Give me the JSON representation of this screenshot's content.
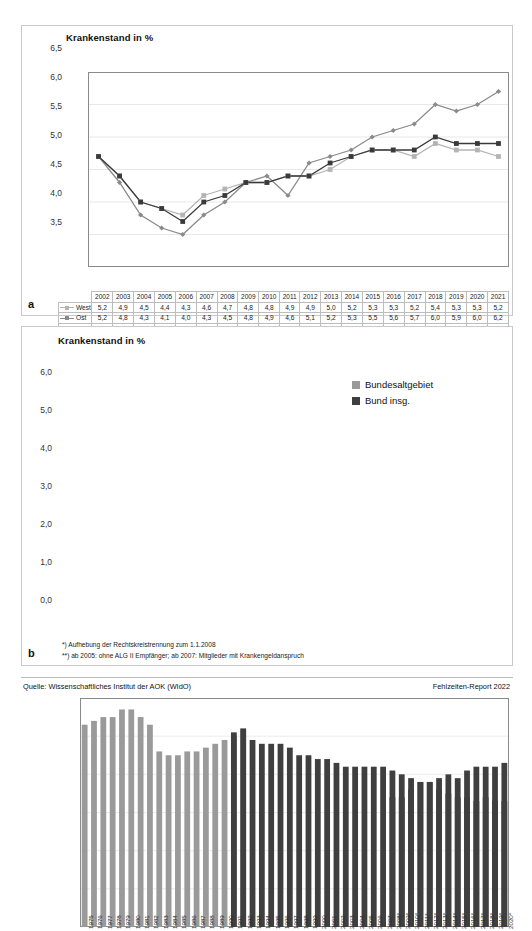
{
  "figure": {
    "source_label": "Quelle: Wissenschaftliches Institut der AOK (WIdO)",
    "report_label": "Fehlzeiten-Report 2022",
    "panel_a_letter": "a",
    "panel_b_letter": "b"
  },
  "panel_a": {
    "title": "Krankenstand in %",
    "yticks": [
      "6,5",
      "6,0",
      "5,5",
      "5,0",
      "4,5",
      "4,0",
      "3,5"
    ],
    "table": {
      "years": [
        "2002",
        "2003",
        "2004",
        "2005",
        "2006",
        "2007",
        "2008",
        "2009",
        "2010",
        "2011",
        "2012",
        "2013",
        "2014",
        "2015",
        "2016",
        "2017",
        "2018",
        "2019",
        "2020",
        "2021"
      ],
      "rows": [
        {
          "label": "West",
          "color": "#b4b4b4",
          "values": [
            "5,2",
            "4,9",
            "4,5",
            "4,4",
            "4,3",
            "4,6",
            "4,7",
            "4,8",
            "4,8",
            "4,9",
            "4,9",
            "5,0",
            "5,2",
            "5,3",
            "5,3",
            "5,2",
            "5,4",
            "5,3",
            "5,3",
            "5,2"
          ]
        },
        {
          "label": "Ost",
          "color": "#8a8a8a",
          "values": [
            "5,2",
            "4,8",
            "4,3",
            "4,1",
            "4,0",
            "4,3",
            "4,5",
            "4,8",
            "4,9",
            "4,6",
            "5,1",
            "5,2",
            "5,3",
            "5,5",
            "5,6",
            "5,7",
            "6,0",
            "5,9",
            "6,0",
            "6,2"
          ]
        },
        {
          "label": "Bund",
          "color": "#3a3a3a",
          "values": [
            "5,2",
            "4,9",
            "4,5",
            "4,4",
            "4,2",
            "4,5",
            "4,6",
            "4,8",
            "4,8",
            "4,9",
            "4,9",
            "5,1",
            "5,2",
            "5,3",
            "5,3",
            "5,3",
            "5,5",
            "5,4",
            "5,4",
            "5,4"
          ]
        }
      ]
    }
  },
  "panel_b": {
    "title": "Krankenstand in %",
    "yticks": [
      "6,0",
      "5,0",
      "4,0",
      "3,0",
      "2,0",
      "1,0",
      "0,0"
    ],
    "legend": [
      {
        "label": "Bundesaltgebiet",
        "color": "#9a9a9a"
      },
      {
        "label": "Bund insg.",
        "color": "#3f3f3f"
      }
    ],
    "footnotes": [
      "*) Aufhebung der Rechtskreistrennung zum 1.1.2008",
      "**) ab 2005: ohne ALG II Empfänger; ab 2007: Mitglieder mit Krankengeldanspruch"
    ]
  },
  "chart_data": [
    {
      "type": "line",
      "title": "Krankenstand in %",
      "xlabel": "",
      "ylabel": "Krankenstand in %",
      "ylim": [
        3.5,
        6.5
      ],
      "ytick_values": [
        3.5,
        4.0,
        4.5,
        5.0,
        5.5,
        6.0,
        6.5
      ],
      "grid": true,
      "legend_position": "table-left",
      "categories": [
        "2002",
        "2003",
        "2004",
        "2005",
        "2006",
        "2007",
        "2008",
        "2009",
        "2010",
        "2011",
        "2012",
        "2013",
        "2014",
        "2015",
        "2016",
        "2017",
        "2018",
        "2019",
        "2020",
        "2021"
      ],
      "series": [
        {
          "name": "West",
          "color": "#b4b4b4",
          "marker": "square",
          "values": [
            5.2,
            4.9,
            4.5,
            4.4,
            4.3,
            4.6,
            4.7,
            4.8,
            4.8,
            4.9,
            4.9,
            5.0,
            5.2,
            5.3,
            5.3,
            5.2,
            5.4,
            5.3,
            5.3,
            5.2
          ]
        },
        {
          "name": "Ost",
          "color": "#8a8a8a",
          "marker": "diamond",
          "values": [
            5.2,
            4.8,
            4.3,
            4.1,
            4.0,
            4.3,
            4.5,
            4.8,
            4.9,
            4.6,
            5.1,
            5.2,
            5.3,
            5.5,
            5.6,
            5.7,
            6.0,
            5.9,
            6.0,
            6.2
          ]
        },
        {
          "name": "Bund",
          "color": "#3a3a3a",
          "marker": "square",
          "values": [
            5.2,
            4.9,
            4.5,
            4.4,
            4.2,
            4.5,
            4.6,
            4.8,
            4.8,
            4.9,
            4.9,
            5.1,
            5.2,
            5.3,
            5.3,
            5.3,
            5.5,
            5.4,
            5.4,
            5.4
          ]
        }
      ]
    },
    {
      "type": "bar",
      "title": "Krankenstand in %",
      "xlabel": "",
      "ylabel": "Krankenstand in %",
      "ylim": [
        0.0,
        6.0
      ],
      "ytick_values": [
        0.0,
        1.0,
        2.0,
        3.0,
        4.0,
        5.0,
        6.0
      ],
      "grid": true,
      "legend_position": "top-right",
      "categories": [
        "1975",
        "1976",
        "1977",
        "1978",
        "1979",
        "1980",
        "1981",
        "1982",
        "1983",
        "1984",
        "1985",
        "1986",
        "1987",
        "1988",
        "1989",
        "1990",
        "1991",
        "1992",
        "1993",
        "1994",
        "1995",
        "1996",
        "1997",
        "1998",
        "1999",
        "2000",
        "2001",
        "2002",
        "2003",
        "2004",
        "2005",
        "2006",
        "2007",
        "2008*",
        "2009*",
        "2010*",
        "2011*",
        "2012*",
        "2013*",
        "2014*",
        "2015*",
        "2016*",
        "2017*",
        "2018*",
        "2019*",
        "2020*"
      ],
      "series": [
        {
          "name": "Bundesaltgebiet",
          "color": "#9a9a9a",
          "values": [
            5.3,
            5.4,
            5.5,
            5.5,
            5.7,
            5.7,
            5.5,
            5.3,
            4.6,
            4.5,
            4.5,
            4.6,
            4.6,
            4.7,
            4.8,
            4.9,
            5.0,
            5.2,
            null,
            null,
            null,
            null,
            null,
            null,
            null,
            null,
            null,
            null,
            null,
            null,
            null,
            null,
            null,
            null,
            null,
            null,
            null,
            null,
            null,
            null,
            null,
            null,
            null,
            null,
            null,
            null
          ]
        },
        {
          "name": "Bund insg.",
          "color": "#3f3f3f",
          "values": [
            null,
            null,
            null,
            null,
            null,
            null,
            null,
            null,
            null,
            null,
            null,
            null,
            null,
            null,
            null,
            null,
            5.1,
            5.2,
            4.9,
            4.8,
            4.8,
            4.8,
            4.7,
            4.5,
            4.5,
            4.4,
            4.4,
            4.3,
            4.2,
            4.2,
            4.2,
            4.2,
            4.2,
            4.1,
            4.0,
            3.9,
            3.8,
            3.8,
            3.6,
            3.5,
            3.4,
            3.4,
            3.3,
            3.4,
            3.3,
            3.3
          ]
        },
        {
          "name": "Bund insg. (2010 onwards)",
          "color": "#3f3f3f",
          "values": [
            null,
            null,
            null,
            null,
            null,
            null,
            null,
            null,
            null,
            null,
            null,
            null,
            null,
            null,
            null,
            null,
            null,
            null,
            null,
            null,
            null,
            null,
            null,
            null,
            null,
            null,
            null,
            null,
            null,
            null,
            null,
            null,
            null,
            3.4,
            3.4,
            3.6,
            3.8,
            3.8,
            3.9,
            4.0,
            3.9,
            4.1,
            4.2,
            4.2,
            4.2,
            4.3
          ]
        }
      ]
    }
  ]
}
